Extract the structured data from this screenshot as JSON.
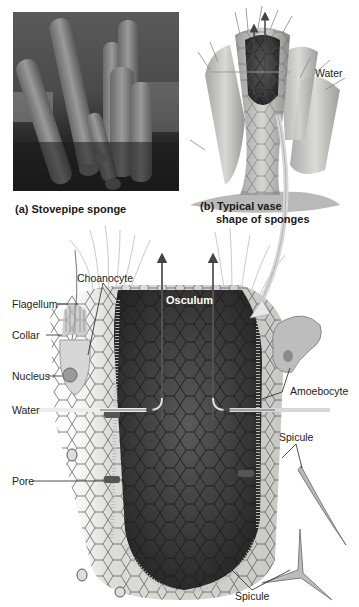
{
  "figure": {
    "panel_a": {
      "caption": "(a) Stovepipe sponge"
    },
    "panel_b": {
      "caption_line1": "(b) Typical vase",
      "caption_line2": "shape of sponges",
      "water_label": "Water"
    },
    "main_diagram": {
      "labels": {
        "choanocyte": "Choanocyte",
        "flagellum": "Flagellum",
        "collar": "Collar",
        "nucleus": "Nucleus",
        "water": "Water",
        "pore": "Pore",
        "osculum": "Osculum",
        "amoebocyte": "Amoebocyte",
        "spicule_upper": "Spicule",
        "spicule_lower": "Spicule"
      }
    },
    "colors": {
      "background": "#ffffff",
      "body_wall": "#d6d6d2",
      "spongocoel": "#3a3a3a",
      "cell_outline": "#4a4a4a",
      "arrow": "#555555",
      "water_arrow": "#e8e8e8",
      "text": "#222222"
    }
  }
}
